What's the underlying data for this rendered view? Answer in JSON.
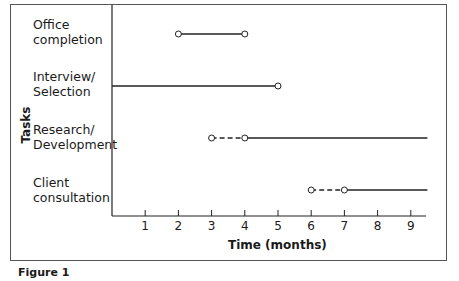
{
  "chart_data": {
    "type": "gantt",
    "title": "",
    "caption": "Figure 1",
    "xlabel": "Time (months)",
    "ylabel": "Tasks",
    "xlim": [
      0,
      9.5
    ],
    "xticks": [
      1,
      2,
      3,
      4,
      5,
      6,
      7,
      8,
      9
    ],
    "grid": false,
    "tasks": [
      {
        "name": "Office\ncompletion",
        "dashed": null,
        "solid": [
          2,
          4
        ],
        "markers": [
          2,
          4
        ]
      },
      {
        "name": "Interview/\nSelection",
        "dashed": null,
        "solid": [
          0,
          5
        ],
        "markers": [
          5
        ]
      },
      {
        "name": "Research/\nDevelopment",
        "dashed": [
          3,
          4
        ],
        "solid": [
          4,
          9.5
        ],
        "markers": [
          3,
          4
        ]
      },
      {
        "name": "Client\nconsultation",
        "dashed": [
          6,
          7
        ],
        "solid": [
          7,
          9.5
        ],
        "markers": [
          6,
          7
        ]
      }
    ]
  },
  "labels": {
    "tasks": [
      "Office\ncompletion",
      "Interview/\nSelection",
      "Research/\nDevelopment",
      "Client\nconsultation"
    ],
    "ylabel": "Tasks",
    "xlabel": "Time (months)",
    "ticks": [
      "1",
      "2",
      "3",
      "4",
      "5",
      "6",
      "7",
      "8",
      "9"
    ],
    "caption": "Figure 1"
  }
}
